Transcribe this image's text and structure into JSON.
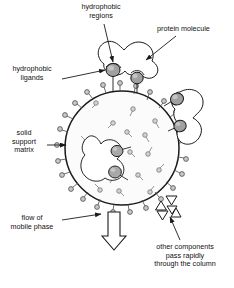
{
  "figure": {
    "background_color": "#ffffff",
    "line_color": "#1a1a1a",
    "ligand_fill": "#a8a8a8",
    "bead_fill": "#fbfbfb",
    "protein_fill": "#ffffff"
  },
  "labels": {
    "hydrophobic_regions_line1": "hydrophobic",
    "hydrophobic_regions_line2": "regions",
    "protein_molecule": "protein molecule",
    "hydrophobic_ligands_line1": "hydrophobic",
    "hydrophobic_ligands_line2": "ligands",
    "solid_support_line1": "solid",
    "solid_support_line2": "support",
    "solid_support_line3": "matrix",
    "flow_line1": "flow of",
    "flow_line2": "mobile phase",
    "other_components_line1": "other components",
    "other_components_line2": "pass rapidly",
    "other_components_line3": "through the column"
  },
  "bead": {
    "center_x": 122,
    "center_y": 148,
    "radius": 57
  },
  "ligands_inside": [
    {
      "x": 96,
      "y": 104,
      "a": 225
    },
    {
      "x": 133,
      "y": 110,
      "a": 200
    },
    {
      "x": 146,
      "y": 100,
      "a": 160
    },
    {
      "x": 112,
      "y": 124,
      "a": 240
    },
    {
      "x": 128,
      "y": 133,
      "a": 30
    },
    {
      "x": 157,
      "y": 124,
      "a": 150
    },
    {
      "x": 107,
      "y": 157,
      "a": 210
    },
    {
      "x": 131,
      "y": 153,
      "a": 20
    },
    {
      "x": 150,
      "y": 152,
      "a": 110
    },
    {
      "x": 160,
      "y": 168,
      "a": 140
    },
    {
      "x": 139,
      "y": 176,
      "a": 50
    },
    {
      "x": 113,
      "y": 178,
      "a": 330
    },
    {
      "x": 95,
      "y": 168,
      "a": 280
    },
    {
      "x": 151,
      "y": 190,
      "a": 70
    },
    {
      "x": 120,
      "y": 194,
      "a": 10
    },
    {
      "x": 99,
      "y": 189,
      "a": 300
    }
  ],
  "ligands_rim": [
    {
      "a": 268
    },
    {
      "a": 283
    },
    {
      "a": 297
    },
    {
      "a": 311
    },
    {
      "a": 325
    },
    {
      "a": 339
    },
    {
      "a": 353
    },
    {
      "a": 7
    },
    {
      "a": 21
    },
    {
      "a": 36
    },
    {
      "a": 50
    },
    {
      "a": 64
    },
    {
      "a": 78
    },
    {
      "a": 92
    },
    {
      "a": 106
    },
    {
      "a": 120
    },
    {
      "a": 134
    },
    {
      "a": 148
    },
    {
      "a": 162
    },
    {
      "a": 176
    },
    {
      "a": 190
    },
    {
      "a": 204
    },
    {
      "a": 218
    },
    {
      "a": 232
    },
    {
      "a": 246
    }
  ],
  "triangles": [
    {
      "x": 171,
      "y": 199,
      "dir": "down",
      "size": 7
    },
    {
      "x": 161,
      "y": 207,
      "dir": "up",
      "size": 7
    },
    {
      "x": 171,
      "y": 209,
      "dir": "down",
      "size": 6
    },
    {
      "x": 162,
      "y": 215,
      "dir": "down",
      "size": 7
    },
    {
      "x": 176,
      "y": 214,
      "dir": "up",
      "size": 7
    }
  ],
  "flow_arrow": {
    "x": 106,
    "y": 214,
    "width": 16,
    "height": 36
  }
}
